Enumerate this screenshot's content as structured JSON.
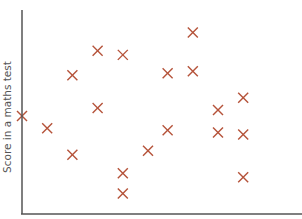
{
  "chart_data": {
    "type": "scatter",
    "title": "",
    "xlabel": "",
    "ylabel": "Score in a maths test",
    "xlim": [
      0,
      100
    ],
    "ylim": [
      0,
      100
    ],
    "grid": false,
    "legend": null,
    "marker": "x",
    "marker_color": "#b5533a",
    "axis_color": "#555555",
    "series": [
      {
        "name": "data",
        "points": [
          {
            "x": 0,
            "y": 48
          },
          {
            "x": 9,
            "y": 42
          },
          {
            "x": 18,
            "y": 68
          },
          {
            "x": 18,
            "y": 29
          },
          {
            "x": 27,
            "y": 80
          },
          {
            "x": 27,
            "y": 52
          },
          {
            "x": 36,
            "y": 78
          },
          {
            "x": 36,
            "y": 20
          },
          {
            "x": 36,
            "y": 10
          },
          {
            "x": 45,
            "y": 31
          },
          {
            "x": 52,
            "y": 69
          },
          {
            "x": 52,
            "y": 41
          },
          {
            "x": 61,
            "y": 89
          },
          {
            "x": 61,
            "y": 70
          },
          {
            "x": 70,
            "y": 51
          },
          {
            "x": 70,
            "y": 40
          },
          {
            "x": 79,
            "y": 57
          },
          {
            "x": 79,
            "y": 39
          },
          {
            "x": 79,
            "y": 18
          }
        ]
      }
    ]
  }
}
